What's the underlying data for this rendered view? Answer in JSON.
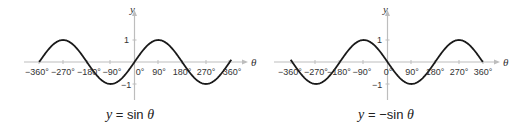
{
  "colors": {
    "axis": "#bdbdbd",
    "curve": "#1a1a1a",
    "text": "#333333"
  },
  "panels": [
    {
      "id": "sin",
      "equation": {
        "lhs": "y",
        "eq": "=",
        "rhs_func": "sin",
        "rhs_var": "θ",
        "prefix": ""
      },
      "axis_labels": {
        "x": "θ",
        "y": "y"
      },
      "x_ticks": [
        "−360°",
        "−270°",
        "−180°",
        "−90°",
        "0°",
        "90°",
        "180°",
        "270°",
        "360°"
      ],
      "y_ticks": [
        "1",
        "−1"
      ]
    },
    {
      "id": "neg-sin",
      "equation": {
        "lhs": "y",
        "eq": "=",
        "rhs_func": "sin",
        "rhs_var": "θ",
        "prefix": "−"
      },
      "axis_labels": {
        "x": "θ",
        "y": "y"
      },
      "x_ticks": [
        "−360°",
        "−270°",
        "−180°",
        "−90°",
        "0°",
        "90°",
        "180°",
        "270°",
        "360°"
      ],
      "y_ticks": [
        "1",
        "−1"
      ]
    }
  ],
  "chart_data": [
    {
      "type": "line",
      "title": "y = sin θ",
      "xlabel": "θ",
      "ylabel": "y",
      "x": [
        -360,
        -270,
        -180,
        -90,
        0,
        90,
        180,
        270,
        360
      ],
      "series": [
        {
          "name": "sin θ",
          "values": [
            0,
            1,
            0,
            -1,
            0,
            1,
            0,
            -1,
            0
          ]
        }
      ],
      "xlim": [
        -360,
        360
      ],
      "ylim": [
        -1,
        1
      ],
      "grid": false
    },
    {
      "type": "line",
      "title": "y = −sin θ",
      "xlabel": "θ",
      "ylabel": "y",
      "x": [
        -360,
        -270,
        -180,
        -90,
        0,
        90,
        180,
        270,
        360
      ],
      "series": [
        {
          "name": "−sin θ",
          "values": [
            0,
            -1,
            0,
            1,
            0,
            -1,
            0,
            1,
            0
          ]
        }
      ],
      "xlim": [
        -360,
        360
      ],
      "ylim": [
        -1,
        1
      ],
      "grid": false
    }
  ]
}
